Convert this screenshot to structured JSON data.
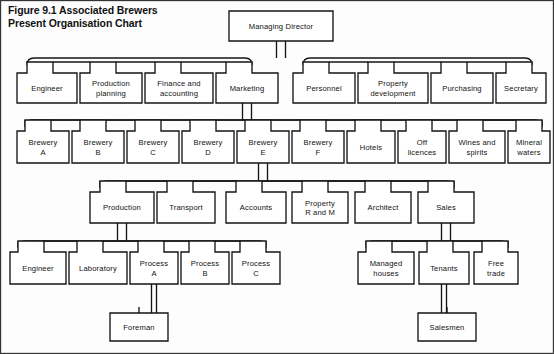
{
  "title": "Figure 9.1 Associated Brewers\nPresent Organisation Chart",
  "colors": {
    "background": "#fdfdfd",
    "line": "#151515",
    "box_fill": "#ffffff",
    "text": "#111111"
  },
  "chart_data": {
    "type": "diagram",
    "diagram_type": "organisation-chart",
    "title": "Figure 9.1 Associated Brewers Present Organisation Chart",
    "root": "Managing Director",
    "levels": [
      {
        "level": 0,
        "nodes": [
          "Managing Director"
        ]
      },
      {
        "level": 1,
        "nodes": [
          "Engineer",
          "Production planning",
          "Finance and accounting",
          "Marketing",
          "Personnel",
          "Property development",
          "Purchasing",
          "Secretary"
        ]
      },
      {
        "level": 2,
        "nodes": [
          "Brewery A",
          "Brewery B",
          "Brewery C",
          "Brewery D",
          "Brewery E",
          "Brewery F",
          "Hotels",
          "Off licences",
          "Wines and spirits",
          "Mineral waters"
        ]
      },
      {
        "level": 3,
        "nodes": [
          "Production",
          "Transport",
          "Accounts",
          "Property R and M",
          "Architect",
          "Sales"
        ]
      },
      {
        "level": 4,
        "nodes": [
          "Engineer",
          "Laboratory",
          "Process A",
          "Process B",
          "Process C",
          "Managed houses",
          "Tenants",
          "Free trade"
        ]
      },
      {
        "level": 5,
        "nodes": [
          "Foreman",
          "Salesmen"
        ]
      }
    ],
    "edges": [
      {
        "from": "Managing Director",
        "to": "Engineer"
      },
      {
        "from": "Managing Director",
        "to": "Production planning"
      },
      {
        "from": "Managing Director",
        "to": "Finance and accounting"
      },
      {
        "from": "Managing Director",
        "to": "Marketing"
      },
      {
        "from": "Managing Director",
        "to": "Personnel"
      },
      {
        "from": "Managing Director",
        "to": "Property development"
      },
      {
        "from": "Managing Director",
        "to": "Purchasing"
      },
      {
        "from": "Managing Director",
        "to": "Secretary"
      },
      {
        "from": "Marketing",
        "to": "Brewery A"
      },
      {
        "from": "Marketing",
        "to": "Brewery B"
      },
      {
        "from": "Marketing",
        "to": "Brewery C"
      },
      {
        "from": "Marketing",
        "to": "Brewery D"
      },
      {
        "from": "Marketing",
        "to": "Brewery E"
      },
      {
        "from": "Marketing",
        "to": "Brewery F"
      },
      {
        "from": "Marketing",
        "to": "Hotels"
      },
      {
        "from": "Marketing",
        "to": "Off licences"
      },
      {
        "from": "Marketing",
        "to": "Wines and spirits"
      },
      {
        "from": "Marketing",
        "to": "Mineral waters"
      },
      {
        "from": "Brewery E",
        "to": "Production"
      },
      {
        "from": "Brewery E",
        "to": "Transport"
      },
      {
        "from": "Brewery E",
        "to": "Accounts"
      },
      {
        "from": "Brewery E",
        "to": "Property R and M"
      },
      {
        "from": "Brewery E",
        "to": "Architect"
      },
      {
        "from": "Brewery E",
        "to": "Sales"
      },
      {
        "from": "Production",
        "to": "Engineer"
      },
      {
        "from": "Production",
        "to": "Laboratory"
      },
      {
        "from": "Production",
        "to": "Process A"
      },
      {
        "from": "Production",
        "to": "Process B"
      },
      {
        "from": "Production",
        "to": "Process C"
      },
      {
        "from": "Sales",
        "to": "Managed houses"
      },
      {
        "from": "Sales",
        "to": "Tenants"
      },
      {
        "from": "Sales",
        "to": "Free trade"
      },
      {
        "from": "Process A",
        "to": "Foreman"
      },
      {
        "from": "Tenants",
        "to": "Salesmen"
      }
    ]
  },
  "nodes": {
    "managing_director": {
      "label": "Managing Director",
      "x": 229,
      "y": 11,
      "w": 104,
      "h": 30
    },
    "level1": [
      {
        "id": "engineer-1",
        "label": "Engineer",
        "x": 17,
        "y": 73,
        "w": 60,
        "h": 30
      },
      {
        "id": "production-planning",
        "label": "Production\nplanning",
        "x": 80,
        "y": 73,
        "w": 62,
        "h": 30
      },
      {
        "id": "finance-and-accounting",
        "label": "Finance and\naccounting",
        "x": 145,
        "y": 73,
        "w": 68,
        "h": 30
      },
      {
        "id": "marketing",
        "label": "Marketing",
        "x": 216,
        "y": 73,
        "w": 62,
        "h": 30
      },
      {
        "id": "personnel",
        "label": "Personnel",
        "x": 293,
        "y": 73,
        "w": 62,
        "h": 30
      },
      {
        "id": "property-development",
        "label": "Property\ndevelopment",
        "x": 358,
        "y": 73,
        "w": 70,
        "h": 30
      },
      {
        "id": "purchasing",
        "label": "Purchasing",
        "x": 431,
        "y": 73,
        "w": 62,
        "h": 30
      },
      {
        "id": "secretary",
        "label": "Secretary",
        "x": 496,
        "y": 73,
        "w": 50,
        "h": 30
      }
    ],
    "level2": [
      {
        "id": "brewery-a",
        "label": "Brewery\nA",
        "x": 17,
        "y": 131,
        "w": 52,
        "h": 32
      },
      {
        "id": "brewery-b",
        "label": "Brewery\nB",
        "x": 72,
        "y": 131,
        "w": 52,
        "h": 32
      },
      {
        "id": "brewery-c",
        "label": "Brewery\nC",
        "x": 127,
        "y": 131,
        "w": 52,
        "h": 32
      },
      {
        "id": "brewery-d",
        "label": "Brewery\nD",
        "x": 182,
        "y": 131,
        "w": 52,
        "h": 32
      },
      {
        "id": "brewery-e",
        "label": "Brewery\nE",
        "x": 237,
        "y": 131,
        "w": 52,
        "h": 32
      },
      {
        "id": "brewery-f",
        "label": "Brewery\nF",
        "x": 292,
        "y": 131,
        "w": 52,
        "h": 32
      },
      {
        "id": "hotels",
        "label": "Hotels",
        "x": 347,
        "y": 131,
        "w": 48,
        "h": 32
      },
      {
        "id": "off-licences",
        "label": "Off\nlicences",
        "x": 398,
        "y": 131,
        "w": 48,
        "h": 32
      },
      {
        "id": "wines-and-spirits",
        "label": "Wines and\nspirits",
        "x": 449,
        "y": 131,
        "w": 56,
        "h": 32
      },
      {
        "id": "mineral-waters",
        "label": "Mineral\nwaters",
        "x": 508,
        "y": 131,
        "w": 42,
        "h": 32
      }
    ],
    "level3": [
      {
        "id": "production",
        "label": "Production",
        "x": 90,
        "y": 192,
        "w": 64,
        "h": 31
      },
      {
        "id": "transport",
        "label": "Transport",
        "x": 157,
        "y": 192,
        "w": 58,
        "h": 31
      },
      {
        "id": "accounts",
        "label": "Accounts",
        "x": 226,
        "y": 192,
        "w": 60,
        "h": 31
      },
      {
        "id": "property-r-and-m",
        "label": "Property\nR and M",
        "x": 292,
        "y": 192,
        "w": 56,
        "h": 31
      },
      {
        "id": "architect",
        "label": "Architect",
        "x": 355,
        "y": 192,
        "w": 56,
        "h": 31
      },
      {
        "id": "sales",
        "label": "Sales",
        "x": 418,
        "y": 192,
        "w": 56,
        "h": 31
      }
    ],
    "level4": [
      {
        "id": "engineer-2",
        "label": "Engineer",
        "x": 10,
        "y": 252,
        "w": 56,
        "h": 32
      },
      {
        "id": "laboratory",
        "label": "Laboratory",
        "x": 69,
        "y": 252,
        "w": 58,
        "h": 32
      },
      {
        "id": "process-a",
        "label": "Process\nA",
        "x": 130,
        "y": 252,
        "w": 48,
        "h": 32
      },
      {
        "id": "process-b",
        "label": "Process\nB",
        "x": 181,
        "y": 252,
        "w": 48,
        "h": 32
      },
      {
        "id": "process-c",
        "label": "Process\nC",
        "x": 232,
        "y": 252,
        "w": 48,
        "h": 32
      },
      {
        "id": "managed-houses",
        "label": "Managed\nhouses",
        "x": 358,
        "y": 252,
        "w": 56,
        "h": 32
      },
      {
        "id": "tenants",
        "label": "Tenants",
        "x": 419,
        "y": 252,
        "w": 50,
        "h": 32
      },
      {
        "id": "free-trade",
        "label": "Free\ntrade",
        "x": 474,
        "y": 252,
        "w": 44,
        "h": 32
      }
    ],
    "level5": [
      {
        "id": "foreman",
        "label": "Foreman",
        "x": 110,
        "y": 313,
        "w": 58,
        "h": 28
      },
      {
        "id": "salesmen",
        "label": "Salesmen",
        "x": 418,
        "y": 313,
        "w": 58,
        "h": 28
      }
    ]
  }
}
